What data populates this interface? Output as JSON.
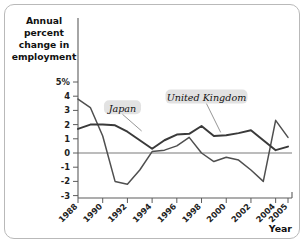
{
  "chart_data": {
    "type": "line",
    "title": "",
    "ylabel": "Annual percent change in employment",
    "xlabel": "Year",
    "x": [
      1988,
      1989,
      1990,
      1991,
      1992,
      1993,
      1994,
      1995,
      1996,
      1997,
      1998,
      1999,
      2000,
      2001,
      2002,
      2003,
      2004,
      2005
    ],
    "xlim": [
      1988,
      2005
    ],
    "ylim": [
      -3,
      5
    ],
    "yticks": [
      5,
      4,
      3,
      2,
      1,
      0,
      -1,
      -2,
      -3
    ],
    "ytick_labels": [
      "5%",
      "4",
      "3",
      "2",
      "1",
      "0",
      "-1",
      "-2",
      "-3"
    ],
    "xticks": [
      1988,
      1990,
      1992,
      1994,
      1996,
      1998,
      2000,
      2002,
      2004,
      2005
    ],
    "xtick_labels": [
      "1988",
      "1990",
      "1992",
      "1994",
      "1996",
      "1998",
      "2000",
      "2002",
      "2004",
      "2005"
    ],
    "grid": false,
    "legend_position": "inline-annotations",
    "series": [
      {
        "name": "Japan",
        "color": "#4f4f4f",
        "values": [
          3.8,
          3.2,
          1.2,
          -2.0,
          -2.2,
          -1.2,
          0.1,
          0.2,
          0.5,
          1.1,
          0.0,
          -0.6,
          -0.3,
          -0.5,
          -1.2,
          -2.0,
          2.3,
          1.1
        ]
      },
      {
        "name": "United Kingdom",
        "color": "#3a3a3a",
        "values": [
          1.7,
          2.0,
          2.0,
          1.95,
          1.5,
          0.9,
          0.3,
          0.9,
          1.3,
          1.35,
          1.9,
          1.2,
          1.25,
          1.4,
          1.6,
          0.9,
          0.2,
          0.45
        ]
      }
    ],
    "annotations": [
      {
        "text": "Japan",
        "x": 1991.6,
        "y": 3.15
      },
      {
        "text": "United Kingdom",
        "x": 1998.4,
        "y": 3.9
      }
    ]
  },
  "axis": {
    "y_title_lines": [
      "Annual",
      "percent",
      "change in",
      "employment"
    ],
    "x_title": "Year"
  },
  "colors": {
    "frame": "#b9b9b9",
    "axis": "#5c5c5c",
    "zero_line": "#a6a6a6",
    "japan": "#4f4f4f",
    "uk": "#3a3a3a",
    "label_box": "#e2e2e2",
    "background": "#ffffff"
  }
}
